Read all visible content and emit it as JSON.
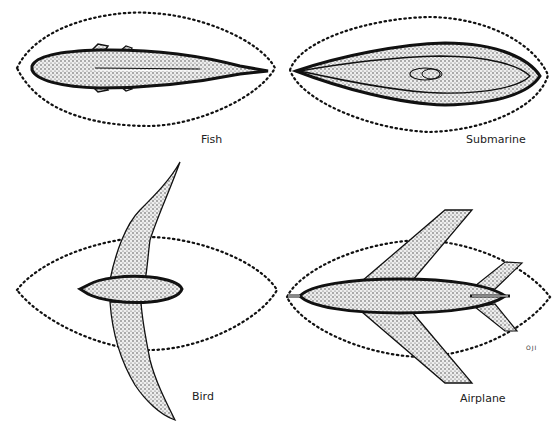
{
  "figure": {
    "panels": [
      {
        "id": "fish",
        "label": "Fish"
      },
      {
        "id": "submarine",
        "label": "Submarine"
      },
      {
        "id": "bird",
        "label": "Bird"
      },
      {
        "id": "airplane",
        "label": "Airplane"
      }
    ],
    "marks": {
      "corner_code": "OJI"
    },
    "colors": {
      "outline": "#111111",
      "fill": "#d9d9d9",
      "dotted_boundary": "#111111"
    }
  }
}
